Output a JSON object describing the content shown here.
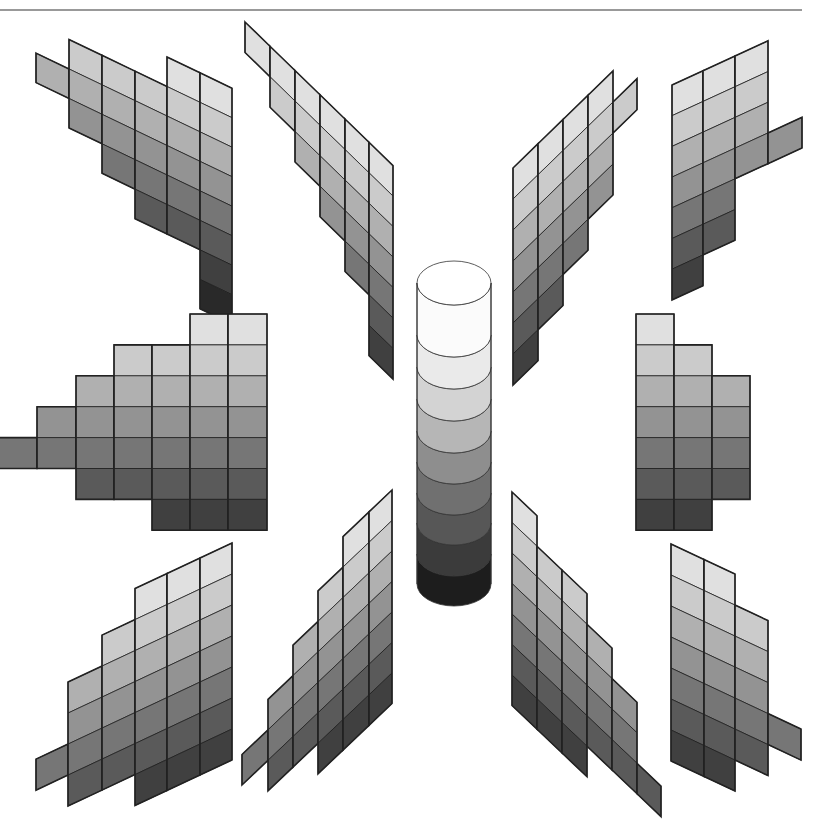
{
  "figure": {
    "title": "",
    "top_rule": {
      "x1": 0,
      "x2": 802,
      "y": 10,
      "color": "#777777"
    }
  },
  "levels": [
    "#f4f4f4",
    "#e0e0e0",
    "#cbcbcb",
    "#b0b0b0",
    "#939393",
    "#767676",
    "#5a5a5a",
    "#404040",
    "#292929",
    "#151515"
  ],
  "panels": [
    {
      "name": "hue-page-top-left",
      "x": [
        36,
        69,
        102,
        135,
        167,
        200,
        232
      ],
      "x0": 167,
      "y0": 57,
      "slope": 0.48,
      "rowH": 29.5,
      "levelOffset": 1,
      "cols": [
        [
          2,
          1
        ],
        [
          1,
          3
        ],
        [
          1,
          4
        ],
        [
          1,
          5
        ],
        [
          0,
          6
        ],
        [
          0,
          8
        ]
      ]
    },
    {
      "name": "hue-page-top-center-left",
      "x": [
        245,
        270,
        295,
        320,
        345,
        369,
        393
      ],
      "x0": 245,
      "y0": 22,
      "slope": 0.97,
      "rowH": 30.5,
      "levelOffset": 1,
      "cols": [
        [
          0,
          1
        ],
        [
          0,
          2
        ],
        [
          0,
          3
        ],
        [
          0,
          4
        ],
        [
          0,
          5
        ],
        [
          0,
          7
        ]
      ]
    },
    {
      "name": "hue-page-top-center-right",
      "x": [
        513,
        538,
        563,
        588,
        613,
        637
      ],
      "x0": 513,
      "y0": 168,
      "slope": -0.97,
      "rowH": 31,
      "levelOffset": 1,
      "cols": [
        [
          0,
          7
        ],
        [
          0,
          6
        ],
        [
          0,
          5
        ],
        [
          0,
          4
        ],
        [
          1,
          1
        ]
      ]
    },
    {
      "name": "hue-page-top-right",
      "x": [
        672,
        703,
        735,
        768,
        802
      ],
      "x0": 672,
      "y0": 85,
      "slope": -0.46,
      "rowH": 30.7,
      "levelOffset": 1,
      "cols": [
        [
          0,
          7
        ],
        [
          0,
          6
        ],
        [
          0,
          4
        ],
        [
          3,
          1
        ]
      ]
    },
    {
      "name": "hue-page-middle-left",
      "x": [
        -4,
        37,
        76,
        114,
        152,
        190,
        228,
        267
      ],
      "x0": 0,
      "y0": 314,
      "slope": 0,
      "rowH": 30.9,
      "levelOffset": 1,
      "cols": [
        [
          4,
          1
        ],
        [
          3,
          2
        ],
        [
          2,
          4
        ],
        [
          1,
          5
        ],
        [
          1,
          6
        ],
        [
          0,
          7
        ],
        [
          0,
          7
        ]
      ]
    },
    {
      "name": "hue-page-middle-right",
      "x": [
        636,
        674,
        712,
        750
      ],
      "x0": 636,
      "y0": 314,
      "slope": 0,
      "rowH": 30.9,
      "levelOffset": 1,
      "cols": [
        [
          0,
          7
        ],
        [
          1,
          6
        ],
        [
          2,
          4
        ]
      ]
    },
    {
      "name": "hue-page-bottom-left",
      "x": [
        36,
        68,
        102,
        135,
        167,
        200,
        232
      ],
      "x0": 232,
      "y0": 543,
      "slope": -0.47,
      "rowH": 31,
      "levelOffset": 1,
      "cols": [
        [
          4,
          1
        ],
        [
          2,
          4
        ],
        [
          1,
          5
        ],
        [
          0,
          7
        ],
        [
          0,
          7
        ],
        [
          0,
          7
        ]
      ]
    },
    {
      "name": "hue-page-bottom-center-left",
      "x": [
        242,
        268,
        293,
        318,
        343,
        369,
        392
      ],
      "x0": 392,
      "y0": 490,
      "slope": -0.95,
      "rowH": 30.5,
      "levelOffset": 1,
      "cols": [
        [
          4,
          1
        ],
        [
          3,
          3
        ],
        [
          2,
          4
        ],
        [
          1,
          6
        ],
        [
          0,
          7
        ],
        [
          0,
          7
        ]
      ]
    },
    {
      "name": "hue-page-bottom-center-right",
      "x": [
        512,
        537,
        562,
        587,
        612,
        637,
        661
      ],
      "x0": 512,
      "y0": 492,
      "slope": 0.95,
      "rowH": 30.5,
      "levelOffset": 1,
      "cols": [
        [
          0,
          7
        ],
        [
          1,
          6
        ],
        [
          1,
          6
        ],
        [
          2,
          4
        ],
        [
          3,
          3
        ],
        [
          5,
          1
        ]
      ]
    },
    {
      "name": "hue-page-bottom-right",
      "x": [
        671,
        704,
        735,
        768,
        801
      ],
      "x0": 671,
      "y0": 544,
      "slope": 0.47,
      "rowH": 31,
      "levelOffset": 1,
      "cols": [
        [
          0,
          7
        ],
        [
          0,
          7
        ],
        [
          1,
          5
        ],
        [
          4,
          1
        ]
      ]
    }
  ],
  "cylinder": {
    "name": "neutral-value-axis",
    "cx": 454,
    "rx": 37,
    "ry": 22,
    "top_y": 283,
    "band_bottoms": [
      335,
      367,
      399,
      431,
      462,
      493,
      523,
      554,
      584
    ],
    "top_color": "#ffffff",
    "band_colors": [
      "#fbfbfb",
      "#eaeaea",
      "#d3d3d3",
      "#b6b6b6",
      "#8e8e8e",
      "#707070",
      "#575757",
      "#3b3b3b",
      "#1d1d1d"
    ]
  }
}
